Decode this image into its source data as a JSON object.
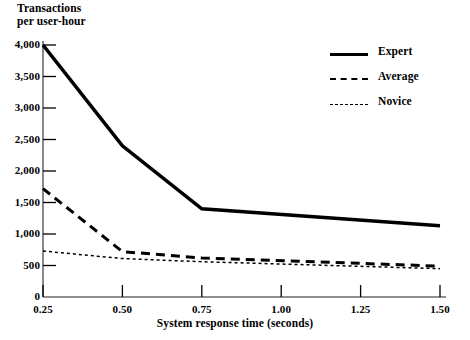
{
  "chart_data": {
    "type": "line",
    "title": "",
    "ylabel": "Transactions\nper user-hour",
    "xlabel": "System response time (seconds)",
    "xlim": [
      0.25,
      1.5
    ],
    "ylim": [
      0,
      4000
    ],
    "grid": false,
    "legend_position": "top-right",
    "x": [
      0.25,
      0.5,
      0.75,
      1.5
    ],
    "xtick_labels": [
      "0.25",
      "0.50",
      "0.75",
      "1.00",
      "1.25",
      "1.50"
    ],
    "xtick_values": [
      0.25,
      0.5,
      0.75,
      1.0,
      1.25,
      1.5
    ],
    "ytick_labels": [
      "0",
      "500",
      "1,000",
      "1,500",
      "2,000",
      "2,500",
      "3,000",
      "3,500",
      "4,000"
    ],
    "ytick_values": [
      0,
      500,
      1000,
      1500,
      2000,
      2500,
      3000,
      3500,
      4000
    ],
    "series": [
      {
        "name": "Expert",
        "style": "solid",
        "values": [
          4000,
          2400,
          1400,
          1130
        ]
      },
      {
        "name": "Average",
        "style": "dashed",
        "values": [
          1720,
          720,
          620,
          490
        ]
      },
      {
        "name": "Novice",
        "style": "dotted",
        "values": [
          730,
          610,
          560,
          450
        ]
      }
    ]
  },
  "axis": {
    "y_title_line1": "Transactions",
    "y_title_line2": "per user-hour",
    "x_title": "System response time (seconds)"
  },
  "ticks": {
    "y": [
      {
        "label": "4,000",
        "value": 4000
      },
      {
        "label": "3,500",
        "value": 3500
      },
      {
        "label": "3,000",
        "value": 3000
      },
      {
        "label": "2,500",
        "value": 2500
      },
      {
        "label": "2,000",
        "value": 2000
      },
      {
        "label": "1,500",
        "value": 1500
      },
      {
        "label": "1,000",
        "value": 1000
      },
      {
        "label": "500",
        "value": 500
      },
      {
        "label": "0",
        "value": 0
      }
    ],
    "x": [
      {
        "label": "0.25",
        "value": 0.25
      },
      {
        "label": "0.50",
        "value": 0.5
      },
      {
        "label": "0.75",
        "value": 0.75
      },
      {
        "label": "1.00",
        "value": 1.0
      },
      {
        "label": "1.25",
        "value": 1.25
      },
      {
        "label": "1.50",
        "value": 1.5
      }
    ]
  },
  "legend": {
    "items": [
      {
        "label": "Expert",
        "style": "solid"
      },
      {
        "label": "Average",
        "style": "dashed"
      },
      {
        "label": "Novice",
        "style": "dotted"
      }
    ]
  },
  "caption": {
    "text": ""
  },
  "colors": {
    "ink": "#000000",
    "axis": "#6b6b6b",
    "background": "#ffffff"
  }
}
